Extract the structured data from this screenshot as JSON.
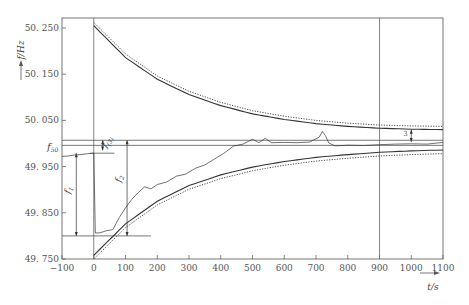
{
  "chart_data": {
    "type": "line",
    "title": "",
    "xlabel": "t/s",
    "ylabel": "f/Hz",
    "xlim": [
      -100,
      1100
    ],
    "ylim": [
      49.75,
      50.27
    ],
    "x_ticks": [
      -100,
      0,
      100,
      200,
      300,
      400,
      500,
      600,
      700,
      800,
      900,
      1000,
      1100
    ],
    "x_tick_labels": [
      "−100",
      "0",
      "100",
      "200",
      "300",
      "400",
      "500",
      "600",
      "700",
      "800",
      "900",
      "1000",
      "1100"
    ],
    "y_ticks": [
      50.25,
      50.15,
      50.05,
      49.95,
      49.85,
      49.75
    ],
    "y_tick_labels": [
      "50. 250",
      "50. 150",
      "50. 050",
      "49. 950",
      "49. 850",
      "49. 750"
    ],
    "grid": false,
    "legend": null,
    "reference_lines": {
      "f50_label": "f",
      "f50_sub": "50",
      "f50_value": 49.996,
      "band_upper": 50.007,
      "band_lower": 49.996,
      "nadir_level": 49.8,
      "vertical_lines_t": [
        0,
        900
      ]
    },
    "annotations": [
      {
        "text": "f",
        "sub": "1",
        "desc": "frequency deviation from pre-disturbance to nadir"
      },
      {
        "text": "f",
        "sub": "2",
        "desc": "deviation from nadir to settled band"
      },
      {
        "text": "f",
        "sub": "(3)",
        "desc": "small offset near f50"
      },
      {
        "text": "3",
        "desc": "steady-state deviation marker near t=1000"
      }
    ],
    "series": [
      {
        "name": "upper envelope (solid)",
        "style": "solid",
        "x": [
          0,
          100,
          200,
          300,
          400,
          500,
          600,
          700,
          800,
          900,
          1000,
          1100
        ],
        "values": [
          50.255,
          50.186,
          50.139,
          50.106,
          50.082,
          50.064,
          50.052,
          50.043,
          50.037,
          50.033,
          50.031,
          50.03
        ]
      },
      {
        "name": "upper envelope (dotted)",
        "style": "dotted",
        "x": [
          0,
          100,
          200,
          300,
          400,
          500,
          600,
          700,
          800,
          900,
          1000,
          1100
        ],
        "values": [
          50.262,
          50.194,
          50.146,
          50.113,
          50.089,
          50.071,
          50.059,
          50.05,
          50.044,
          50.04,
          50.038,
          50.037
        ]
      },
      {
        "name": "lower envelope (solid)",
        "style": "solid",
        "x": [
          0,
          100,
          200,
          300,
          400,
          500,
          600,
          700,
          800,
          900,
          1000,
          1100
        ],
        "values": [
          49.758,
          49.826,
          49.875,
          49.909,
          49.932,
          49.949,
          49.961,
          49.97,
          49.976,
          49.981,
          49.984,
          49.986
        ]
      },
      {
        "name": "lower envelope (dotted)",
        "style": "dotted",
        "x": [
          0,
          100,
          200,
          300,
          400,
          500,
          600,
          700,
          800,
          900,
          1000,
          1100
        ],
        "values": [
          49.75,
          49.818,
          49.867,
          49.901,
          49.924,
          49.941,
          49.953,
          49.962,
          49.968,
          49.973,
          49.976,
          49.978
        ]
      },
      {
        "name": "measured frequency",
        "style": "solid-thin",
        "x": [
          -100,
          -80,
          -60,
          -40,
          -20,
          0,
          5,
          20,
          40,
          60,
          80,
          100,
          120,
          140,
          160,
          180,
          200,
          230,
          260,
          290,
          320,
          350,
          380,
          410,
          440,
          470,
          500,
          520,
          540,
          560,
          600,
          640,
          680,
          710,
          720,
          730,
          740,
          760,
          800,
          850,
          900,
          950,
          1000,
          1050,
          1100
        ],
        "values": [
          49.972,
          49.973,
          49.975,
          49.976,
          49.978,
          49.979,
          49.805,
          49.808,
          49.81,
          49.815,
          49.838,
          49.862,
          49.878,
          49.895,
          49.905,
          49.903,
          49.91,
          49.918,
          49.928,
          49.935,
          49.945,
          49.955,
          49.965,
          49.98,
          49.993,
          50.0,
          50.008,
          50.003,
          50.01,
          50.003,
          50.001,
          50.003,
          50.002,
          50.015,
          50.025,
          50.018,
          50.0,
          49.996,
          49.995,
          49.997,
          49.996,
          50.0,
          49.998,
          50.0,
          50.001
        ]
      }
    ]
  }
}
